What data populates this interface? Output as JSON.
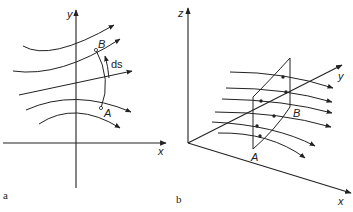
{
  "figure_a": {
    "caption": "a",
    "axis_x": "x",
    "axis_y": "y",
    "point_a": "A",
    "point_b": "B",
    "element_label": "ds"
  },
  "figure_b": {
    "caption": "b",
    "axis_x": "x",
    "axis_y": "y",
    "axis_z": "z",
    "point_a": "A",
    "point_b": "B"
  }
}
